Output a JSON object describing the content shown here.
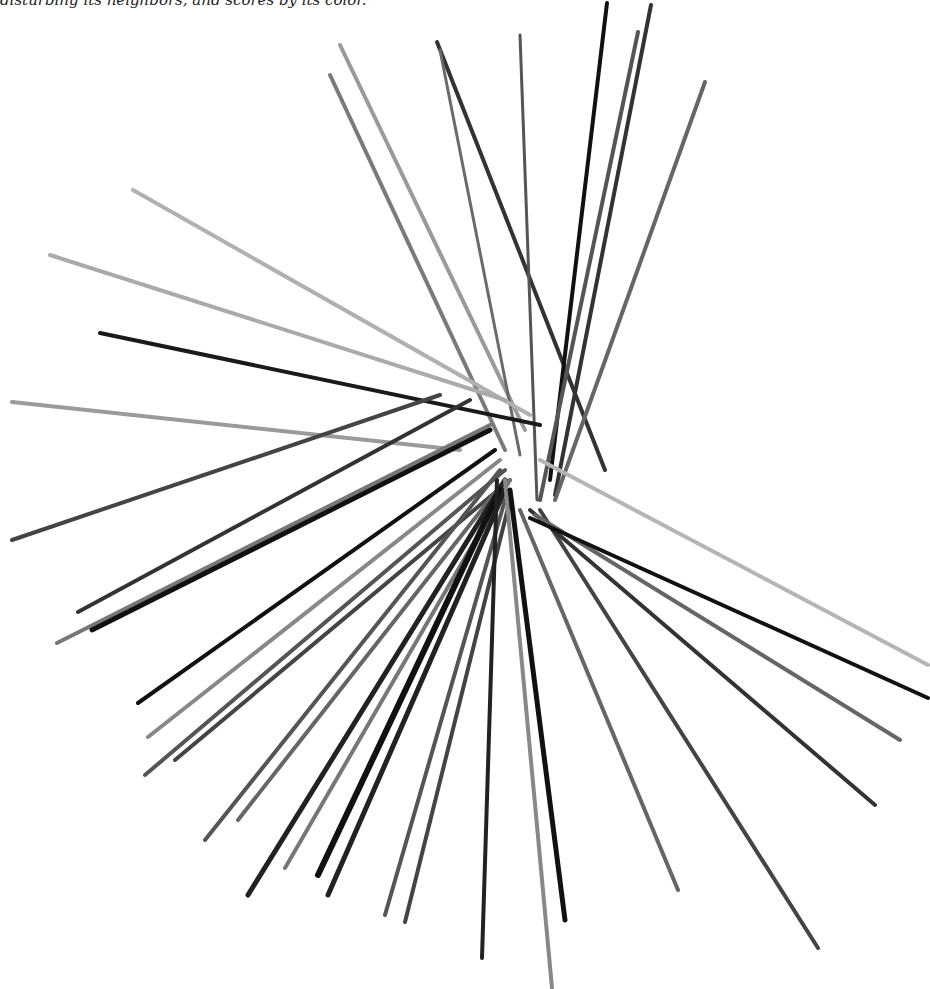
{
  "caption": {
    "text": "disturbing its neighbors, and scores by its color."
  },
  "image": {
    "subject": "pick-up sticks (mikado) scattered in a radial pile",
    "background": "#ffffff",
    "width": 930,
    "height": 989
  },
  "sticks": [
    {
      "x1": 340,
      "y1": 45,
      "x2": 525,
      "y2": 430,
      "c": "#9a9a9a",
      "w": 4
    },
    {
      "x1": 330,
      "y1": 75,
      "x2": 505,
      "y2": 450,
      "c": "#7a7a7a",
      "w": 4
    },
    {
      "x1": 437,
      "y1": 42,
      "x2": 605,
      "y2": 470,
      "c": "#333333",
      "w": 4
    },
    {
      "x1": 440,
      "y1": 50,
      "x2": 520,
      "y2": 455,
      "c": "#6a6a6a",
      "w": 3
    },
    {
      "x1": 520,
      "y1": 35,
      "x2": 537,
      "y2": 500,
      "c": "#555555",
      "w": 3
    },
    {
      "x1": 607,
      "y1": 3,
      "x2": 550,
      "y2": 480,
      "c": "#111111",
      "w": 4
    },
    {
      "x1": 638,
      "y1": 32,
      "x2": 540,
      "y2": 500,
      "c": "#555555",
      "w": 4
    },
    {
      "x1": 651,
      "y1": 5,
      "x2": 555,
      "y2": 495,
      "c": "#333333",
      "w": 4
    },
    {
      "x1": 705,
      "y1": 82,
      "x2": 555,
      "y2": 500,
      "c": "#666666",
      "w": 4
    },
    {
      "x1": 133,
      "y1": 190,
      "x2": 530,
      "y2": 415,
      "c": "#b0b0b0",
      "w": 4
    },
    {
      "x1": 50,
      "y1": 255,
      "x2": 505,
      "y2": 400,
      "c": "#aaaaaa",
      "w": 4
    },
    {
      "x1": 100,
      "y1": 333,
      "x2": 540,
      "y2": 425,
      "c": "#1a1a1a",
      "w": 4
    },
    {
      "x1": 12,
      "y1": 402,
      "x2": 460,
      "y2": 450,
      "c": "#9a9a9a",
      "w": 4
    },
    {
      "x1": 12,
      "y1": 540,
      "x2": 440,
      "y2": 395,
      "c": "#444444",
      "w": 4
    },
    {
      "x1": 78,
      "y1": 612,
      "x2": 470,
      "y2": 400,
      "c": "#333333",
      "w": 4
    },
    {
      "x1": 57,
      "y1": 643,
      "x2": 490,
      "y2": 425,
      "c": "#777777",
      "w": 4
    },
    {
      "x1": 92,
      "y1": 630,
      "x2": 490,
      "y2": 430,
      "c": "#111111",
      "w": 5
    },
    {
      "x1": 138,
      "y1": 703,
      "x2": 495,
      "y2": 450,
      "c": "#111111",
      "w": 4
    },
    {
      "x1": 148,
      "y1": 737,
      "x2": 500,
      "y2": 460,
      "c": "#888888",
      "w": 4
    },
    {
      "x1": 145,
      "y1": 775,
      "x2": 505,
      "y2": 470,
      "c": "#555555",
      "w": 4
    },
    {
      "x1": 175,
      "y1": 760,
      "x2": 510,
      "y2": 480,
      "c": "#444444",
      "w": 4
    },
    {
      "x1": 205,
      "y1": 840,
      "x2": 500,
      "y2": 470,
      "c": "#555555",
      "w": 4
    },
    {
      "x1": 238,
      "y1": 820,
      "x2": 505,
      "y2": 480,
      "c": "#666666",
      "w": 4
    },
    {
      "x1": 248,
      "y1": 895,
      "x2": 505,
      "y2": 480,
      "c": "#222222",
      "w": 5
    },
    {
      "x1": 285,
      "y1": 868,
      "x2": 510,
      "y2": 480,
      "c": "#777777",
      "w": 4
    },
    {
      "x1": 318,
      "y1": 875,
      "x2": 500,
      "y2": 490,
      "c": "#111111",
      "w": 6
    },
    {
      "x1": 328,
      "y1": 895,
      "x2": 505,
      "y2": 490,
      "c": "#222222",
      "w": 5
    },
    {
      "x1": 385,
      "y1": 915,
      "x2": 505,
      "y2": 500,
      "c": "#555555",
      "w": 4
    },
    {
      "x1": 405,
      "y1": 922,
      "x2": 510,
      "y2": 500,
      "c": "#444444",
      "w": 4
    },
    {
      "x1": 482,
      "y1": 958,
      "x2": 497,
      "y2": 480,
      "c": "#222222",
      "w": 4
    },
    {
      "x1": 552,
      "y1": 988,
      "x2": 505,
      "y2": 480,
      "c": "#888888",
      "w": 4
    },
    {
      "x1": 565,
      "y1": 920,
      "x2": 510,
      "y2": 490,
      "c": "#111111",
      "w": 5
    },
    {
      "x1": 678,
      "y1": 890,
      "x2": 520,
      "y2": 510,
      "c": "#666666",
      "w": 4
    },
    {
      "x1": 818,
      "y1": 948,
      "x2": 540,
      "y2": 510,
      "c": "#444444",
      "w": 4
    },
    {
      "x1": 875,
      "y1": 805,
      "x2": 530,
      "y2": 510,
      "c": "#333333",
      "w": 4
    },
    {
      "x1": 900,
      "y1": 740,
      "x2": 535,
      "y2": 515,
      "c": "#666666",
      "w": 4
    },
    {
      "x1": 928,
      "y1": 698,
      "x2": 530,
      "y2": 518,
      "c": "#111111",
      "w": 4
    },
    {
      "x1": 928,
      "y1": 665,
      "x2": 540,
      "y2": 460,
      "c": "#b5b5b5",
      "w": 4
    }
  ]
}
